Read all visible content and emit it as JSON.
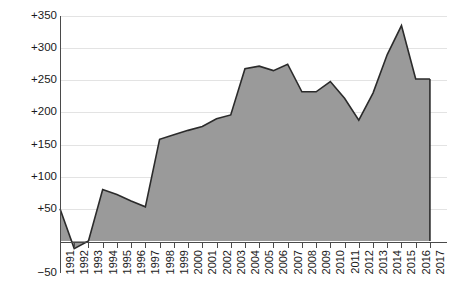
{
  "chart_data": {
    "type": "area",
    "title": "",
    "subtitle": "",
    "xlabel": "",
    "ylabel": "",
    "grid": true,
    "legend": null,
    "xlim": [
      1991,
      2017
    ],
    "ylim": [
      -50,
      350
    ],
    "ytick_labels": [
      "+350",
      "+300",
      "+250",
      "+200",
      "+150",
      "+100",
      "+50",
      "-50"
    ],
    "ytick_values": [
      350,
      300,
      250,
      200,
      150,
      100,
      50,
      -50
    ],
    "categories": [
      "1991",
      "1992",
      "1993",
      "1994",
      "1995",
      "1996",
      "1997",
      "1998",
      "1999",
      "2000",
      "2001",
      "2002",
      "2003",
      "2004",
      "2005",
      "2006",
      "2007",
      "2008",
      "2009",
      "2010",
      "2011",
      "2012",
      "2013",
      "2014",
      "2015",
      "2016",
      "2017"
    ],
    "values": [
      50,
      -12,
      0,
      80,
      72,
      62,
      53,
      158,
      165,
      172,
      178,
      190,
      196,
      268,
      272,
      265,
      275,
      232,
      232,
      248,
      222,
      188,
      230,
      290,
      335,
      252,
      252
    ],
    "series": [
      {
        "name": "value",
        "values": [
          50,
          -12,
          0,
          80,
          72,
          62,
          53,
          158,
          165,
          172,
          178,
          190,
          196,
          268,
          272,
          265,
          275,
          232,
          232,
          248,
          222,
          188,
          230,
          290,
          335,
          252,
          252
        ]
      }
    ],
    "colors": {
      "fill": "#9a9a9a",
      "stroke": "#2b2b2b",
      "grid": "#e3e3e3",
      "axis": "#4a4a4a",
      "text": "#1a1a1a",
      "background": "#ffffff"
    }
  }
}
